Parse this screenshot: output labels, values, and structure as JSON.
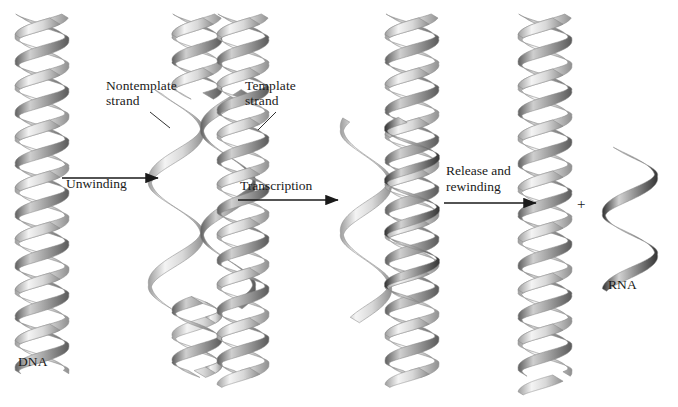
{
  "figure": {
    "background": "#ffffff",
    "ink": "#1a1a1a"
  },
  "labels": {
    "dna": "DNA",
    "rna": "RNA",
    "nontemplate_strand": "Nontemplate\nstrand",
    "template_strand": "Template\nstrand",
    "plus": "+"
  },
  "arrows": [
    {
      "id": "unwinding",
      "label": "Unwinding",
      "x": 62,
      "y": 178,
      "length": 96,
      "text_x": 66,
      "text_y": 176
    },
    {
      "id": "transcription",
      "label": "Transcription",
      "x": 238,
      "y": 200,
      "length": 100,
      "text_x": 240,
      "text_y": 178
    },
    {
      "id": "release",
      "label": "Release and\nrewinding",
      "x": 444,
      "y": 203,
      "length": 92,
      "text_x": 446,
      "text_y": 163
    }
  ],
  "stages": [
    {
      "id": "stage-1-dna",
      "name": "intact-double-helix",
      "label": "DNA",
      "label_x": 18,
      "label_y": 362,
      "strands": [
        "template",
        "nontemplate"
      ]
    },
    {
      "id": "stage-2-unwound",
      "name": "unwound-strands",
      "strands": [
        "nontemplate",
        "template"
      ]
    },
    {
      "id": "stage-3-transcribing",
      "name": "transcription-bubble",
      "strands": [
        "nontemplate",
        "template",
        "rna"
      ]
    },
    {
      "id": "stage-4-rewound",
      "name": "rewound-double-helix",
      "strands": [
        "template",
        "nontemplate"
      ]
    },
    {
      "id": "stage-5-rna",
      "name": "released-rna",
      "label": "RNA",
      "label_x": 610,
      "label_y": 284,
      "strands": [
        "rna"
      ]
    }
  ],
  "colors": {
    "ribbon_light_hi": "#f2f2f2",
    "ribbon_light_lo": "#9a9a9a",
    "ribbon_dark_hi": "#c9c9c9",
    "ribbon_dark_lo": "#5a5a5a",
    "rna_hi": "#d6d6d6",
    "rna_lo": "#2e2e2e",
    "outline": "#777777"
  }
}
